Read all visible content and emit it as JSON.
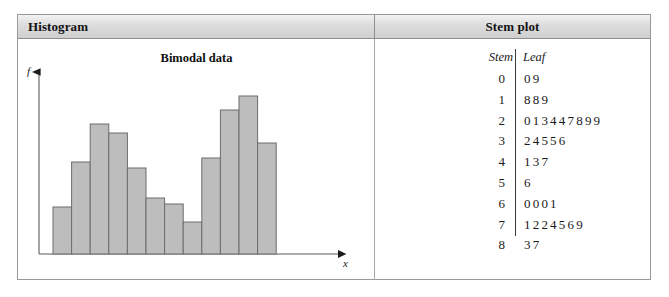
{
  "header": {
    "left_title": "Histogram",
    "right_title": "Stem plot"
  },
  "histogram": {
    "title": "Bimodal data",
    "y_axis_label": "f",
    "x_axis_label": "x"
  },
  "stem_plot": {
    "stem_header": "Stem",
    "leaf_header": "Leaf",
    "rows": [
      {
        "stem": "0",
        "leaf": "09"
      },
      {
        "stem": "1",
        "leaf": "889"
      },
      {
        "stem": "2",
        "leaf": "013447899"
      },
      {
        "stem": "3",
        "leaf": "24556"
      },
      {
        "stem": "4",
        "leaf": "137"
      },
      {
        "stem": "5",
        "leaf": "6"
      },
      {
        "stem": "6",
        "leaf": "0001"
      },
      {
        "stem": "7",
        "leaf": "1224569"
      },
      {
        "stem": "8",
        "leaf": "37"
      }
    ]
  },
  "chart_data": {
    "type": "bar",
    "title": "Bimodal data",
    "xlabel": "x",
    "ylabel": "f",
    "categories": [
      "1",
      "2",
      "3",
      "4",
      "5",
      "6",
      "7",
      "8",
      "9",
      "10",
      "11",
      "12"
    ],
    "values": [
      47,
      92,
      130,
      121,
      86,
      56,
      50,
      32,
      96,
      144,
      158,
      111
    ],
    "ylim": [
      0,
      175
    ],
    "grid": false,
    "legend": null,
    "bar_fill": "#bdbdbd",
    "bar_stroke": "#6d6d6d",
    "note": "Bimodal frequency distribution: two peaks, first at bar 3, second at bar 11"
  },
  "colors": {
    "bar_fill": "#bdbdbd",
    "bar_stroke": "#6d6d6d",
    "axis": "#4a4a4a",
    "frame_border": "#9a9a9a",
    "header_bg": "#dcdcdc",
    "text": "#131313"
  }
}
